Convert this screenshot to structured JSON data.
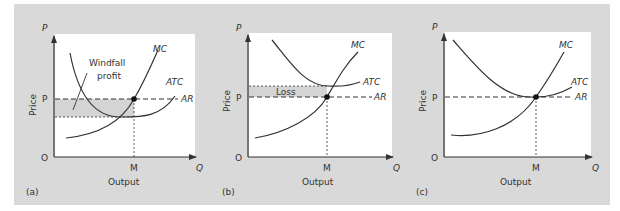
{
  "figure": {
    "background_color": "#d9d9d9",
    "plot_color": "#ffffff",
    "shade_color": "#d4d4d4",
    "line_color": "#333333"
  },
  "panels": [
    {
      "id": "a",
      "caption": "(a)",
      "y_axis_symbol": "P",
      "y_axis_label": "Price",
      "x_axis_symbol": "Q",
      "x_axis_label": "Output",
      "origin_label": "O",
      "price_tick": "P",
      "quantity_tick": "M",
      "curves": {
        "mc": "MC",
        "atc": "ATC",
        "ar": "AR"
      },
      "annotation": "Windfall",
      "annotation_line2": "profit"
    },
    {
      "id": "b",
      "caption": "(b)",
      "y_axis_symbol": "P",
      "y_axis_label": "Price",
      "x_axis_symbol": "Q",
      "x_axis_label": "Output",
      "origin_label": "O",
      "price_tick": "P",
      "quantity_tick": "M",
      "curves": {
        "mc": "MC",
        "atc": "ATC",
        "ar": "AR"
      },
      "annotation": "Loss"
    },
    {
      "id": "c",
      "caption": "(c)",
      "y_axis_symbol": "P",
      "y_axis_label": "Price",
      "x_axis_symbol": "Q",
      "x_axis_label": "Output",
      "origin_label": "O",
      "price_tick": "P",
      "quantity_tick": "M",
      "curves": {
        "mc": "MC",
        "atc": "ATC",
        "ar": "AR"
      }
    }
  ]
}
